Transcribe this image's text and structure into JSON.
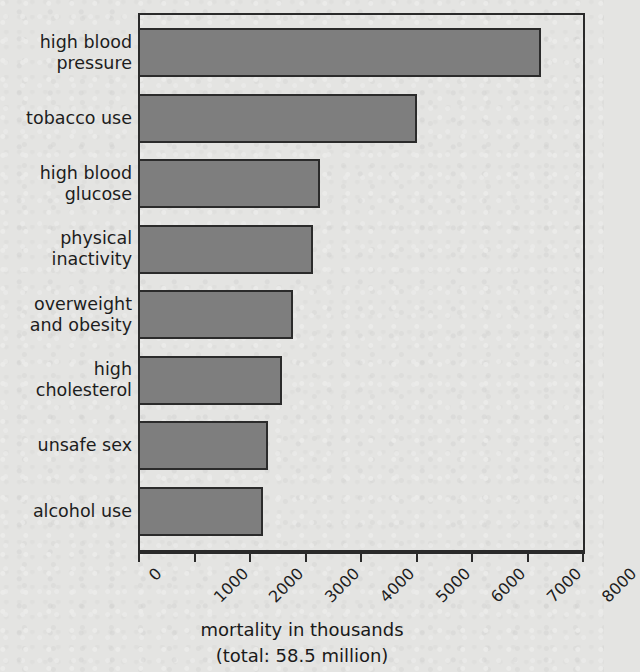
{
  "chart_data": {
    "type": "bar",
    "orientation": "horizontal",
    "title": "",
    "xlabel": "mortality in thousands",
    "xlabel_sub": "(total: 58.5 million)",
    "ylabel": "",
    "categories": [
      "high blood\npressure",
      "tobacco use",
      "high blood\nglucose",
      "physical\ninactivity",
      "overweight\nand obesity",
      "high\ncholesterol",
      "unsafe sex",
      "alcohol use"
    ],
    "values": [
      7250,
      5025,
      3280,
      3150,
      2790,
      2600,
      2350,
      2250
    ],
    "xlim": [
      0,
      8050
    ],
    "xticks": [
      0,
      1000,
      2000,
      3000,
      4000,
      5000,
      6000,
      7000,
      8000
    ],
    "xtick_labels": [
      "0",
      "1000",
      "2000",
      "3000",
      "4000",
      "5000",
      "6000",
      "7000",
      "8000"
    ],
    "grid": false,
    "legend": null,
    "bar_color": "#7e7e7e",
    "bar_edge_color": "#2b2b2b",
    "background_color": "#e4e4e2",
    "axis_color": "#2a2a2a",
    "total_note": "58.5 million"
  }
}
